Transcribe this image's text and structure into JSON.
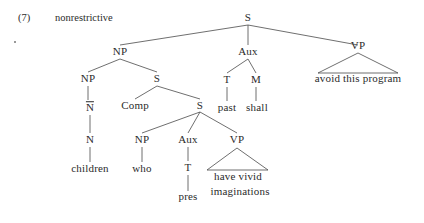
{
  "figure": {
    "example_number": "(7)",
    "caption": "nonrestrictive",
    "type": "syntax-tree",
    "nodes": {
      "root_s": "S",
      "np_subject": "NP",
      "aux_main": "Aux",
      "vp_main": "VP",
      "np_inner": "NP",
      "s_relative": "S",
      "t_main": "T",
      "m_main": "M",
      "vp_main_terminal": "avoid this program",
      "nbar": "N",
      "comp": "Comp",
      "s_embedded": "S",
      "n_head": "N",
      "np_embedded": "NP",
      "aux_embedded": "Aux",
      "vp_embedded": "VP",
      "t_main_terminal": "past",
      "m_main_terminal": "shall",
      "n_terminal": "children",
      "np_embedded_terminal": "who",
      "t_embedded": "T",
      "vp_embedded_terminal_line1": "have vivid",
      "vp_embedded_terminal_line2": "imaginations",
      "t_embedded_terminal": "pres"
    },
    "colors": {
      "text": "#2b2b2b",
      "line": "#4a4a4a",
      "background": "#ffffff"
    }
  }
}
